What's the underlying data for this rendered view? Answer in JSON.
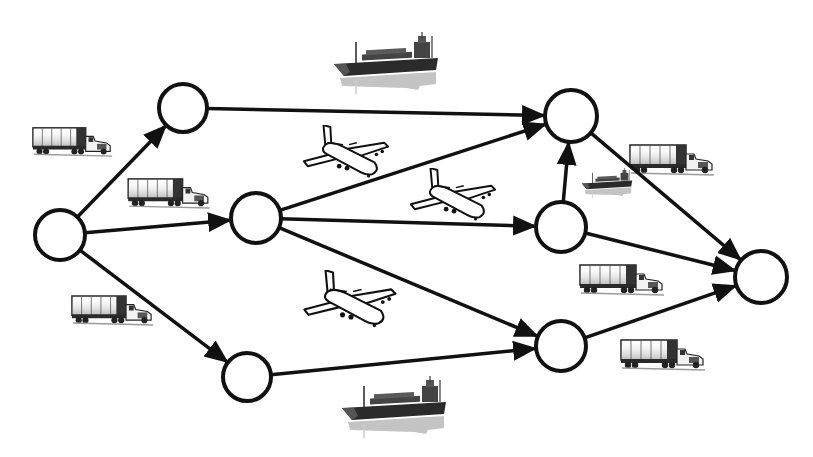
{
  "diagram": {
    "type": "transportation-network",
    "colors": {
      "stroke": "#111111",
      "node_fill": "#ffffff",
      "background": "#ffffff",
      "shadow": "#bdbdbd",
      "vehicle_dark": "#2a2a2a"
    },
    "nodes": [
      {
        "id": "A",
        "x": 60,
        "y": 235,
        "r": 25
      },
      {
        "id": "B",
        "x": 183,
        "y": 108,
        "r": 24
      },
      {
        "id": "C",
        "x": 256,
        "y": 218,
        "r": 25
      },
      {
        "id": "H",
        "x": 247,
        "y": 377,
        "r": 24
      },
      {
        "id": "D",
        "x": 571,
        "y": 116,
        "r": 26
      },
      {
        "id": "E",
        "x": 561,
        "y": 227,
        "r": 25
      },
      {
        "id": "F",
        "x": 561,
        "y": 346,
        "r": 25
      },
      {
        "id": "G",
        "x": 761,
        "y": 277,
        "r": 26
      }
    ],
    "edges": [
      {
        "from": "A",
        "to": "B",
        "mode": "truck"
      },
      {
        "from": "A",
        "to": "C",
        "mode": "truck"
      },
      {
        "from": "A",
        "to": "H",
        "mode": "truck"
      },
      {
        "from": "B",
        "to": "D",
        "mode": "ship"
      },
      {
        "from": "C",
        "to": "D",
        "mode": "air"
      },
      {
        "from": "C",
        "to": "E",
        "mode": "air"
      },
      {
        "from": "C",
        "to": "F",
        "mode": "air"
      },
      {
        "from": "H",
        "to": "F",
        "mode": "ship"
      },
      {
        "from": "E",
        "to": "D",
        "mode": "ship"
      },
      {
        "from": "D",
        "to": "G",
        "mode": "truck"
      },
      {
        "from": "E",
        "to": "G",
        "mode": "truck"
      },
      {
        "from": "F",
        "to": "G",
        "mode": "truck"
      }
    ],
    "icons": [
      {
        "kind": "truck",
        "x": 30,
        "y": 125,
        "w": 85,
        "h": 33
      },
      {
        "kind": "truck",
        "x": 126,
        "y": 176,
        "w": 86,
        "h": 34
      },
      {
        "kind": "truck",
        "x": 70,
        "y": 293,
        "w": 85,
        "h": 34
      },
      {
        "kind": "truck",
        "x": 628,
        "y": 142,
        "w": 88,
        "h": 35
      },
      {
        "kind": "truck",
        "x": 578,
        "y": 262,
        "w": 88,
        "h": 35
      },
      {
        "kind": "truck",
        "x": 619,
        "y": 337,
        "w": 88,
        "h": 35
      },
      {
        "kind": "ship",
        "x": 332,
        "y": 32,
        "w": 112,
        "h": 62
      },
      {
        "kind": "ship",
        "x": 340,
        "y": 376,
        "w": 112,
        "h": 62
      },
      {
        "kind": "ship",
        "x": 580,
        "y": 168,
        "w": 56,
        "h": 30
      },
      {
        "kind": "plane",
        "x": 298,
        "y": 125,
        "w": 98,
        "h": 55
      },
      {
        "kind": "plane",
        "x": 405,
        "y": 168,
        "w": 98,
        "h": 55
      },
      {
        "kind": "plane",
        "x": 298,
        "y": 270,
        "w": 106,
        "h": 60
      }
    ]
  }
}
